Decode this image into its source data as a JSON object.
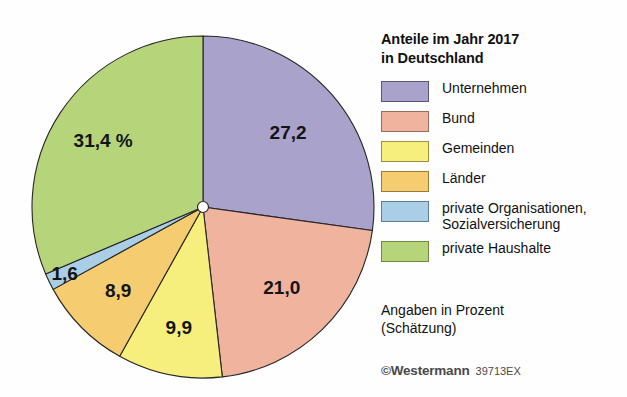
{
  "legend": {
    "title": "Anteile im Jahr 2017\nin Deutschland",
    "items": [
      {
        "label": "Unternehmen",
        "color": "#a9a2cb",
        "border": "#5b5478"
      },
      {
        "label": "Bund",
        "color": "#f0b39d",
        "border": "#9c6a56"
      },
      {
        "label": "Gemeinden",
        "color": "#f7ef7d",
        "border": "#9a9141"
      },
      {
        "label": "Länder",
        "color": "#f5cd70",
        "border": "#9a7a34"
      },
      {
        "label": "private Organisationen,\nSozialversicherung",
        "color": "#a9cee6",
        "border": "#5a7f96"
      },
      {
        "label": "private Haushalte",
        "color": "#b6d57b",
        "border": "#6e8a42"
      }
    ]
  },
  "notes": {
    "units": "Angaben in Prozent\n(Schätzung)",
    "credit_symbol": "©",
    "credit_name": "Westermann",
    "credit_code": "39713EX"
  },
  "chart_data": {
    "type": "pie",
    "title": "Anteile im Jahr 2017 in Deutschland",
    "unit": "Prozent",
    "note": "Schätzung",
    "start_angle_deg": 0,
    "direction": "clockwise",
    "labels": [
      "Unternehmen",
      "Bund",
      "Gemeinden",
      "Länder",
      "private Organisationen, Sozialversicherung",
      "private Haushalte"
    ],
    "values": [
      27.2,
      21.0,
      9.9,
      8.9,
      1.6,
      31.4
    ],
    "value_labels": [
      "27,2",
      "21,0",
      "9,9",
      "8,9",
      "1,6",
      "31,4 %"
    ],
    "colors": [
      "#a9a2cb",
      "#f0b39d",
      "#f7ef7d",
      "#f5cd70",
      "#a9cee6",
      "#b6d57b"
    ],
    "legend_position": "right",
    "grid": false
  }
}
